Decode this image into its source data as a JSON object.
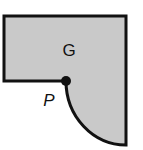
{
  "diagram": {
    "type": "geometry-region",
    "region": {
      "label": "G",
      "fill_color": "#c9c9c9",
      "stroke_color": "#111111"
    },
    "point": {
      "label": "P",
      "color": "#111111"
    }
  }
}
